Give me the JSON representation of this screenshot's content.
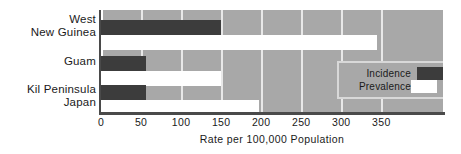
{
  "chart_data": {
    "type": "bar",
    "orientation": "horizontal",
    "title": "",
    "xlabel": "Rate per 100,000 Population",
    "ylabel": "",
    "categories": [
      "West\nNew Guinea",
      "Guam",
      "Kil Peninsula\nJapan"
    ],
    "series": [
      {
        "name": "Incidence",
        "values": [
          150,
          56,
          56
        ]
      },
      {
        "name": "Prevalence",
        "values": [
          345,
          150,
          197
        ]
      }
    ],
    "xlim": [
      0,
      427
    ],
    "xticks": [
      0,
      50,
      100,
      150,
      200,
      250,
      300,
      350
    ],
    "xtick_labels": [
      "0",
      "50",
      "100",
      "150",
      "200",
      "250",
      "300",
      "350"
    ],
    "grid": true,
    "grid_axis": "x",
    "legend_position": "inner-right",
    "colors": {
      "plot_background": "#a8a8a8",
      "gridline": "#e8e8e8",
      "incidence": "#3c3c3c",
      "prevalence": "#ffffff",
      "axis": "#4a4a4a",
      "text": "#1a1a1a",
      "legend_background": "#a8a8a8",
      "legend_border": "#d8d8d8",
      "page_background": "#ffffff"
    }
  },
  "legend": {
    "items": [
      {
        "label": "Incidence"
      },
      {
        "label": "Prevalence"
      }
    ]
  }
}
